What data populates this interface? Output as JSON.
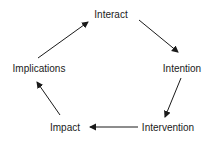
{
  "diagram": {
    "type": "cycle",
    "colors": {
      "text": "#1a1a1a",
      "arrow": "#1a1a1a",
      "background": "#ffffff"
    },
    "nodes": [
      {
        "id": "interact",
        "label": "Interact",
        "x": 111,
        "y": 15
      },
      {
        "id": "intention",
        "label": "Intention",
        "x": 182,
        "y": 69
      },
      {
        "id": "intervention",
        "label": "Intervention",
        "x": 168,
        "y": 128
      },
      {
        "id": "impact",
        "label": "Impact",
        "x": 65,
        "y": 128
      },
      {
        "id": "implications",
        "label": "Implications",
        "x": 39,
        "y": 69
      }
    ],
    "edges": [
      {
        "from": "interact",
        "to": "intention",
        "x1": 139,
        "y1": 20,
        "x2": 178,
        "y2": 52
      },
      {
        "from": "intention",
        "to": "intervention",
        "x1": 181,
        "y1": 78,
        "x2": 165,
        "y2": 117
      },
      {
        "from": "intervention",
        "to": "impact",
        "x1": 138,
        "y1": 127,
        "x2": 90,
        "y2": 127
      },
      {
        "from": "impact",
        "to": "implications",
        "x1": 60,
        "y1": 115,
        "x2": 37,
        "y2": 82
      },
      {
        "from": "implications",
        "to": "interact",
        "x1": 38,
        "y1": 58,
        "x2": 88,
        "y2": 22
      }
    ]
  }
}
